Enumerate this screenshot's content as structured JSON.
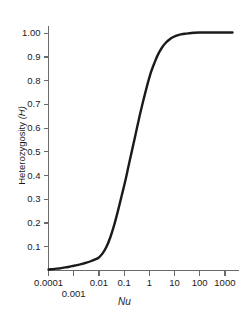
{
  "chart_data": {
    "type": "line",
    "title": "",
    "xlabel": "Nu",
    "ylabel": "Heterozygosity (H)",
    "xscale": "log",
    "xlim": [
      0.0001,
      2000
    ],
    "ylim": [
      0.0,
      1.02
    ],
    "grid": false,
    "legend": null,
    "xticks": [
      {
        "value": 0.0001,
        "label": "0.0001",
        "row": 1
      },
      {
        "value": 0.001,
        "label": "0.001",
        "row": 2
      },
      {
        "value": 0.01,
        "label": "0.01",
        "row": 1
      },
      {
        "value": 0.1,
        "label": "0.1",
        "row": 1
      },
      {
        "value": 1,
        "label": "1",
        "row": 1
      },
      {
        "value": 10,
        "label": "10",
        "row": 1
      },
      {
        "value": 100,
        "label": "100",
        "row": 1
      },
      {
        "value": 1000,
        "label": "1000",
        "row": 1
      }
    ],
    "yticks": [
      {
        "value": 0.1,
        "label": "0.1"
      },
      {
        "value": 0.2,
        "label": "0.2"
      },
      {
        "value": 0.3,
        "label": "0.3"
      },
      {
        "value": 0.4,
        "label": "0.4"
      },
      {
        "value": 0.5,
        "label": "0.5"
      },
      {
        "value": 0.6,
        "label": "0.6"
      },
      {
        "value": 0.7,
        "label": "0.7"
      },
      {
        "value": 0.8,
        "label": "0.8"
      },
      {
        "value": 0.9,
        "label": "0.9"
      },
      {
        "value": 1.0,
        "label": "1.00"
      }
    ],
    "series": [
      {
        "name": "Heterozygosity vs Nu",
        "color": "#1a1a1a",
        "linewidth": 2.4,
        "x": [
          0.0001,
          0.00015,
          0.00022,
          0.00032,
          0.00047,
          0.00068,
          0.001,
          0.0015,
          0.0022,
          0.0032,
          0.0047,
          0.0068,
          0.01,
          0.014,
          0.02,
          0.028,
          0.04,
          0.056,
          0.08,
          0.11,
          0.15,
          0.2,
          0.28,
          0.4,
          0.56,
          0.8,
          1.1,
          1.6,
          2.2,
          3.2,
          4.5,
          6.5,
          9,
          13,
          18,
          26,
          40,
          60,
          100,
          200,
          500,
          1000,
          2000
        ],
        "y": [
          0.004,
          0.006,
          0.008,
          0.01,
          0.013,
          0.016,
          0.02,
          0.024,
          0.028,
          0.033,
          0.039,
          0.046,
          0.055,
          0.072,
          0.1,
          0.138,
          0.19,
          0.248,
          0.315,
          0.375,
          0.44,
          0.5,
          0.57,
          0.645,
          0.71,
          0.775,
          0.828,
          0.875,
          0.91,
          0.94,
          0.96,
          0.975,
          0.984,
          0.991,
          0.995,
          0.998,
          1.0,
          1.002,
          1.003,
          1.003,
          1.003,
          1.003,
          1.003
        ]
      }
    ],
    "axis_color": "#6b6b6b",
    "text_color": "#1a1a1a",
    "background": "#ffffff"
  }
}
